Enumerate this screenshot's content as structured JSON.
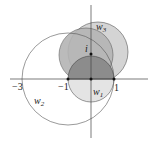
{
  "diagram": {
    "type": "complex-plane circles",
    "axes": {
      "x_ticks": [
        "-3",
        "-1",
        "1"
      ],
      "y_marker": "i"
    },
    "circles": [
      {
        "name": "w1",
        "label": "w",
        "sub": "1",
        "description": "unit circle, filled dark gray (upper half), lighter lower half"
      },
      {
        "name": "w2",
        "label": "w",
        "sub": "2",
        "description": "large outline circle through -3 and 1"
      },
      {
        "name": "w3",
        "label": "w",
        "sub": "3",
        "description": "light gray disk above, through 1"
      }
    ],
    "labels": {
      "minus3": "−3",
      "minus1": "−1",
      "one": "1",
      "i": "i",
      "w": "w",
      "sub1": "1",
      "sub2": "2",
      "sub3": "3"
    },
    "colors": {
      "w3_fill": "#d4d4d4",
      "mid_fill": "#b8b8b8",
      "w1_fill": "#8e8e8e",
      "w1_lower": "#e2e2e2",
      "stroke": "#444444"
    }
  }
}
